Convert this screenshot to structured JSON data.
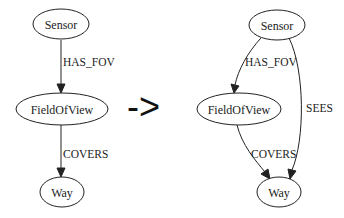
{
  "diagram": {
    "before": {
      "nodes": [
        {
          "id": "sensor",
          "label": "Sensor"
        },
        {
          "id": "fov",
          "label": "FieldOfView"
        },
        {
          "id": "way",
          "label": "Way"
        }
      ],
      "edges": [
        {
          "from": "sensor",
          "to": "fov",
          "label": "HAS_FOV"
        },
        {
          "from": "fov",
          "to": "way",
          "label": "COVERS"
        }
      ]
    },
    "transform_symbol": "->",
    "after": {
      "nodes": [
        {
          "id": "sensor",
          "label": "Sensor"
        },
        {
          "id": "fov",
          "label": "FieldOfView"
        },
        {
          "id": "way",
          "label": "Way"
        }
      ],
      "edges": [
        {
          "from": "sensor",
          "to": "fov",
          "label": "HAS_FOV"
        },
        {
          "from": "fov",
          "to": "way",
          "label": "COVERS"
        },
        {
          "from": "sensor",
          "to": "way",
          "label": "SEES"
        }
      ]
    }
  },
  "colors": {
    "stroke": "#222222",
    "background": "#ffffff"
  }
}
